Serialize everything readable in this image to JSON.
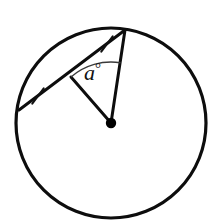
{
  "figure": {
    "kind": "circle-geometry-diagram",
    "background_color": "#ffffff",
    "stroke_color": "#000000",
    "width": 220,
    "height": 222
  },
  "circle": {
    "name": "circle",
    "center_x": 111,
    "center_y": 123,
    "radius": 95,
    "stroke_width": 3.2,
    "fill": "none",
    "stroke_color": "#0d0d0d"
  },
  "center_point": {
    "name": "center-dot",
    "x": 111,
    "y": 123,
    "radius": 5.2,
    "fill": "#000000"
  },
  "chord": {
    "name": "chord",
    "x1": 19,
    "y1": 110,
    "x2": 125,
    "y2": 30,
    "stroke_width": 3.0,
    "stroke_color": "#0d0d0d"
  },
  "radii": [
    {
      "name": "radius-to-chord-midpoint",
      "x1": 111,
      "y1": 123,
      "x2": 71,
      "y2": 77,
      "stroke_width": 3.0,
      "stroke_color": "#0d0d0d"
    },
    {
      "name": "radius-to-chord-endpoint",
      "x1": 111,
      "y1": 123,
      "x2": 125,
      "y2": 30,
      "stroke_width": 3.0,
      "stroke_color": "#0d0d0d"
    }
  ],
  "tick_marks": [
    {
      "name": "tick-mark-lower",
      "cx": 38,
      "cy": 96,
      "length": 19,
      "angle_deg": 127,
      "stroke_width": 2.0,
      "stroke_color": "#111111"
    },
    {
      "name": "tick-mark-upper",
      "cx": 107,
      "cy": 44,
      "length": 19,
      "angle_deg": 127,
      "stroke_width": 2.0,
      "stroke_color": "#111111"
    }
  ],
  "angle_arc": {
    "name": "angle-arc",
    "center_x": 111,
    "center_y": 123,
    "radius": 61,
    "start_angle_deg": 229,
    "end_angle_deg": 279,
    "stroke_width": 1.3,
    "stroke_color": "#3a3a3a",
    "fill": "none"
  },
  "labels": {
    "angle": {
      "name": "angle-label",
      "variable": "a",
      "degree_symbol": "°",
      "x": 84,
      "y": 80,
      "font_size": 22,
      "color": "#111111"
    }
  }
}
